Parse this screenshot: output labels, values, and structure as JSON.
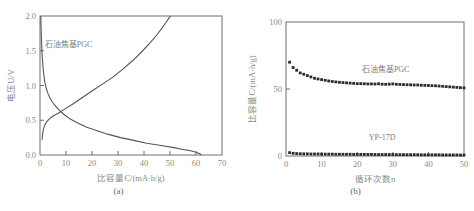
{
  "figure": {
    "background": "#ffffff",
    "line_color": "#555555",
    "axis_color": "#6e6e6e",
    "text_color": "#8a8a8a"
  },
  "panels": [
    {
      "id": "a",
      "caption": "(a)",
      "annotation": "石油焦基PGC"
    },
    {
      "id": "b",
      "caption": "(b)",
      "annotation_pgc": "石油焦基PGC",
      "annotation_yp": "YP-17D"
    }
  ],
  "chart_data": [
    {
      "type": "line",
      "title": "(a)",
      "xlabel": "比容量C/(mA·h/g)",
      "ylabel": "电压U/V",
      "xlim": [
        0,
        70
      ],
      "ylim": [
        0,
        2.0
      ],
      "xticks": [
        0,
        10,
        20,
        30,
        40,
        50,
        60,
        70
      ],
      "xticklabels": [
        "0",
        "10",
        "20",
        "30",
        "40",
        "50",
        "60",
        "70"
      ],
      "yticks": [
        0.0,
        0.5,
        1.0,
        1.5,
        2.0
      ],
      "yticklabels": [
        "0.0",
        "0.5",
        "1.0",
        "1.5",
        "2.0"
      ],
      "grid": false,
      "legend": null,
      "annotations": [
        {
          "text": "石油焦基PGC",
          "x": 11,
          "y": 1.55
        }
      ],
      "series": [
        {
          "name": "discharge",
          "x": [
            0.3,
            0.5,
            0.8,
            1.2,
            1.8,
            2.4,
            3.0,
            3.8,
            4.6,
            5.6,
            7.0,
            9.0,
            11.5,
            14.5,
            18.0,
            22.0,
            26.0,
            31.0,
            36.0,
            41.0,
            46.0,
            51.0,
            55.0,
            58.0,
            60.0,
            61.5,
            62.0
          ],
          "y": [
            2.0,
            1.72,
            1.45,
            1.24,
            1.06,
            0.96,
            0.89,
            0.82,
            0.77,
            0.72,
            0.66,
            0.59,
            0.52,
            0.46,
            0.4,
            0.35,
            0.3,
            0.25,
            0.21,
            0.17,
            0.14,
            0.11,
            0.08,
            0.06,
            0.04,
            0.02,
            0.0
          ]
        },
        {
          "name": "charge",
          "x": [
            0.8,
            1.0,
            1.3,
            1.8,
            2.6,
            3.6,
            5.0,
            7.0,
            9.5,
            12.5,
            16.0,
            20.0,
            24.0,
            28.0,
            32.0,
            36.0,
            39.5,
            42.5,
            45.0,
            47.0,
            48.5,
            49.6,
            50.3
          ],
          "y": [
            0.22,
            0.3,
            0.37,
            0.43,
            0.48,
            0.52,
            0.56,
            0.6,
            0.66,
            0.73,
            0.82,
            0.92,
            1.02,
            1.12,
            1.24,
            1.37,
            1.5,
            1.62,
            1.73,
            1.83,
            1.91,
            1.97,
            2.0
          ]
        }
      ]
    },
    {
      "type": "scatter",
      "title": "(b)",
      "xlabel": "循环次数n",
      "ylabel": "比容量C/(mA·h/g)",
      "xlim": [
        0,
        50
      ],
      "ylim": [
        0,
        100
      ],
      "xticks": [
        0,
        10,
        20,
        30,
        40,
        50
      ],
      "xticklabels": [
        "0",
        "10",
        "20",
        "30",
        "40",
        "50"
      ],
      "yticks": [
        0,
        50,
        100
      ],
      "yticklabels": [
        "0",
        "50",
        "100"
      ],
      "grid": false,
      "legend": null,
      "annotations": [
        {
          "text": "石油焦基PGC",
          "x": 28,
          "y": 63
        },
        {
          "text": "YP-17D",
          "x": 27,
          "y": 12
        }
      ],
      "series": [
        {
          "name": "石油焦基PGC",
          "x": [
            1,
            2,
            3,
            4,
            5,
            6,
            7,
            8,
            9,
            10,
            11,
            12,
            13,
            14,
            15,
            16,
            17,
            18,
            19,
            20,
            21,
            22,
            23,
            24,
            25,
            26,
            27,
            28,
            29,
            30,
            31,
            32,
            33,
            34,
            35,
            36,
            37,
            38,
            39,
            40,
            41,
            42,
            43,
            44,
            45,
            46,
            47,
            48,
            49,
            50
          ],
          "y": [
            70,
            66,
            64,
            62,
            61,
            60,
            59,
            58,
            57.5,
            57,
            56.5,
            56,
            55.6,
            55.3,
            55,
            54.8,
            54.6,
            54.4,
            54.2,
            54,
            54,
            53.9,
            53.8,
            53.8,
            53.7,
            53.9,
            53.6,
            53.5,
            53.6,
            53.8,
            53.5,
            53.4,
            53.3,
            53.2,
            53.1,
            53,
            53,
            52.8,
            52.7,
            52.6,
            52.5,
            52.4,
            52.2,
            52,
            51.8,
            51.6,
            51.4,
            51.2,
            51,
            50.8
          ]
        },
        {
          "name": "YP-17D",
          "x": [
            1,
            2,
            3,
            4,
            5,
            6,
            7,
            8,
            9,
            10,
            11,
            12,
            13,
            14,
            15,
            16,
            17,
            18,
            19,
            20,
            21,
            22,
            23,
            24,
            25,
            26,
            27,
            28,
            29,
            30,
            31,
            32,
            33,
            34,
            35,
            36,
            37,
            38,
            39,
            40,
            41,
            42,
            43,
            44,
            45,
            46,
            47,
            48,
            49,
            50
          ],
          "y": [
            2.5,
            2.0,
            1.8,
            1.7,
            1.6,
            1.6,
            1.5,
            1.5,
            1.5,
            1.4,
            1.4,
            1.4,
            1.4,
            1.3,
            1.3,
            1.3,
            1.3,
            1.3,
            1.2,
            1.2,
            1.2,
            1.2,
            1.2,
            1.2,
            1.1,
            1.1,
            1.1,
            1.1,
            1.1,
            1.1,
            1.0,
            1.0,
            1.0,
            1.0,
            1.0,
            1.0,
            1.0,
            0.9,
            0.9,
            0.9,
            0.9,
            0.9,
            0.9,
            0.8,
            0.8,
            0.8,
            0.8,
            0.8,
            0.7,
            0.7
          ]
        }
      ]
    }
  ]
}
